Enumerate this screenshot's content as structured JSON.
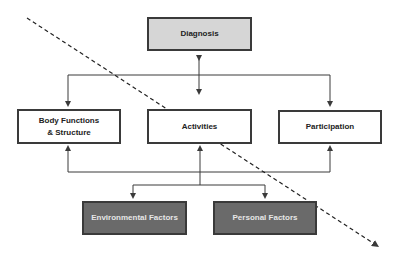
{
  "diagram": {
    "nodes": {
      "diagnosis": {
        "label": "Diagnosis"
      },
      "body_functions": {
        "line1": "Body Functions",
        "line2": "& Structure"
      },
      "activities": {
        "label": "Activities"
      },
      "participation": {
        "label": "Participation"
      },
      "environmental": {
        "label": "Environmental Factors"
      },
      "personal": {
        "label": "Personal Factors"
      }
    },
    "colors": {
      "light_fill": "#d6d6d6",
      "dark_fill": "#6a6a6a",
      "line": "#3a3a3a"
    }
  }
}
